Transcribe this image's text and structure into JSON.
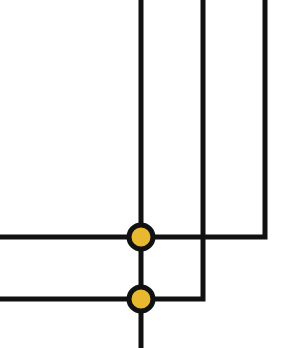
{
  "diagram": {
    "type": "wire-junction",
    "colors": {
      "wire": "#111111",
      "junction_fill": "#e8b830",
      "background": "#ffffff"
    },
    "wire_width": 5,
    "wires": [
      {
        "id": "v1",
        "points": [
          [
            141,
            0
          ],
          [
            141,
            348
          ]
        ]
      },
      {
        "id": "v2-to-h2",
        "points": [
          [
            203,
            0
          ],
          [
            203,
            299
          ],
          [
            0,
            299
          ]
        ]
      },
      {
        "id": "v3-to-h1",
        "points": [
          [
            265,
            0
          ],
          [
            265,
            237
          ],
          [
            0,
            237
          ]
        ]
      }
    ],
    "junctions": [
      {
        "id": "j1",
        "cx": 141,
        "cy": 237,
        "r": 12
      },
      {
        "id": "j2",
        "cx": 141,
        "cy": 299,
        "r": 12
      }
    ]
  }
}
